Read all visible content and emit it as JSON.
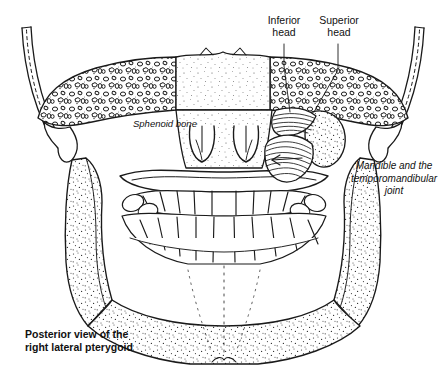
{
  "figure": {
    "title": "Posterior view of the right lateral pterygoid",
    "background_color": "#ffffff",
    "ink_color": "#1a1a1a",
    "labels": {
      "inferior_head": "Inferior\nhead",
      "superior_head": "Superior\nhead",
      "mandible_tmj": "Mandible and the\ntemporomandibular\njoint",
      "sphenoid_bone": "Sphenoid bone",
      "caption": "Posterior view of the\nright lateral pterygoid"
    },
    "structures": [
      {
        "name": "sphenoid-bone",
        "texture": "cancellous-cells"
      },
      {
        "name": "zygomatic-arch-left",
        "texture": "double-line-dashed"
      },
      {
        "name": "zygomatic-arch-right",
        "texture": "double-line-dashed"
      },
      {
        "name": "pterygoid-plates",
        "texture": "outline-loops"
      },
      {
        "name": "lateral-pterygoid-muscle",
        "texture": "parallel-striations"
      },
      {
        "name": "mandibular-condyle",
        "texture": "stipple"
      },
      {
        "name": "mandibular-ramus-right",
        "texture": "stipple"
      },
      {
        "name": "mandibular-ramus-left",
        "texture": "stipple"
      },
      {
        "name": "mandible-body",
        "texture": "stipple"
      },
      {
        "name": "upper-teeth-arch",
        "texture": "outline"
      },
      {
        "name": "lower-teeth-arch",
        "texture": "outline"
      }
    ]
  }
}
